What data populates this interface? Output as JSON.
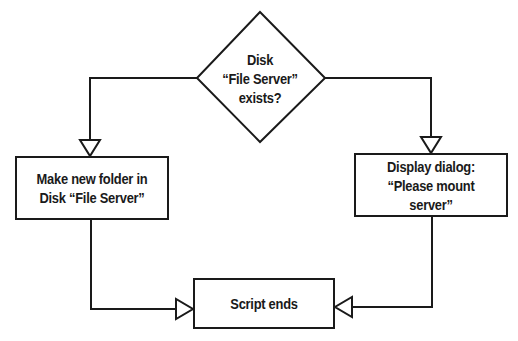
{
  "diagram": {
    "type": "flowchart",
    "nodes": {
      "decision": {
        "shape": "diamond",
        "line1": "Disk",
        "line2": "“File Server”",
        "line3": "exists?"
      },
      "make_folder": {
        "shape": "rectangle",
        "line1": "Make new folder in",
        "line2": "Disk “File Server”"
      },
      "display_dialog": {
        "shape": "rectangle",
        "line1": "Display dialog:",
        "line2": "“Please mount server”"
      },
      "script_ends": {
        "shape": "rectangle",
        "line1": "Script ends"
      }
    },
    "edges": [
      {
        "from": "decision",
        "to": "make_folder",
        "exit": "left"
      },
      {
        "from": "decision",
        "to": "display_dialog",
        "exit": "right"
      },
      {
        "from": "make_folder",
        "to": "script_ends"
      },
      {
        "from": "display_dialog",
        "to": "script_ends"
      }
    ],
    "colors": {
      "stroke": "#1a1a1a",
      "background": "#ffffff",
      "text": "#1a1a1a"
    }
  }
}
